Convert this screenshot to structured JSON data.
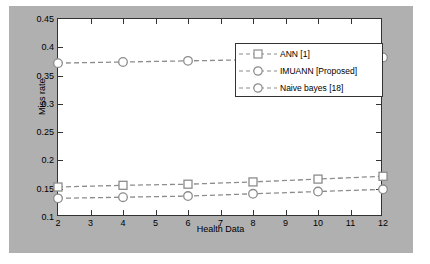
{
  "chart_data": {
    "type": "line",
    "title": "",
    "xlabel": "Health Data",
    "ylabel": "Miss rate",
    "xlim": [
      2,
      12
    ],
    "ylim": [
      0.1,
      0.45
    ],
    "xticks": [
      "2",
      "3",
      "4",
      "5",
      "6",
      "7",
      "8",
      "9",
      "10",
      "11",
      "12"
    ],
    "yticks": [
      "0.1",
      "0.15",
      "0.2",
      "0.25",
      "0.3",
      "0.35",
      "0.4",
      "0.45"
    ],
    "grid": false,
    "legend_position": "top-right",
    "x": [
      2,
      4,
      6,
      8,
      10,
      12
    ],
    "series": [
      {
        "name": "ANN [1]",
        "color": "#8c8c8c",
        "marker": "square",
        "linestyle": "dashed",
        "values": [
          0.153,
          0.156,
          0.158,
          0.162,
          0.167,
          0.172
        ]
      },
      {
        "name": "IMUANN [Proposed]",
        "color": "#8c8c8c",
        "marker": "circle",
        "linestyle": "dashed",
        "values": [
          0.133,
          0.135,
          0.137,
          0.141,
          0.145,
          0.149
        ]
      },
      {
        "name": "Naive bayes [18]",
        "color": "#8c8c8c",
        "marker": "circle",
        "linestyle": "dashed",
        "values": [
          0.372,
          0.374,
          0.376,
          0.378,
          0.38,
          0.382
        ]
      }
    ]
  },
  "legend": {
    "entries": [
      {
        "label": "ANN [1]"
      },
      {
        "label": "IMUANN [Proposed]"
      },
      {
        "label": "Naive bayes [18]"
      }
    ]
  },
  "axes": {
    "xlabel": "Health Data",
    "ylabel": "Miss rate"
  },
  "colors": {
    "figure_background": "#b0b0b0",
    "plot_background": "#ffffff",
    "series": "#8c8c8c",
    "axis": "#333333"
  }
}
